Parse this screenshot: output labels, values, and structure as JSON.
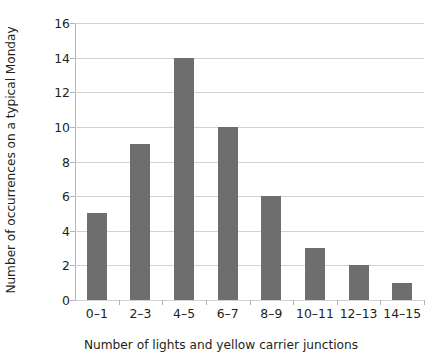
{
  "chart_data": {
    "type": "bar",
    "title": "",
    "subtitle": "",
    "xlabel": "Number of lights and yellow carrier junctions",
    "ylabel": "Number of occurrences on a typical Monday",
    "categories": [
      "0–1",
      "2–3",
      "4–5",
      "6–7",
      "8–9",
      "10–11",
      "12–13",
      "14–15"
    ],
    "values": [
      5,
      9,
      14,
      10,
      6,
      3,
      2,
      1
    ],
    "ylim": [
      0,
      16
    ],
    "ytick_labels": [
      "0",
      "2",
      "4",
      "6",
      "8",
      "10",
      "12",
      "14",
      "16"
    ],
    "ytick_values": [
      0,
      2,
      4,
      6,
      8,
      10,
      12,
      14,
      16
    ],
    "grid": "horizontal",
    "legend": "none",
    "bar_color": "#6e6e6e",
    "gridline_color": "#d2d2d2",
    "axis_color": "#b4b4b4",
    "background_color": "#ffffff",
    "text_color": "#231f20"
  }
}
